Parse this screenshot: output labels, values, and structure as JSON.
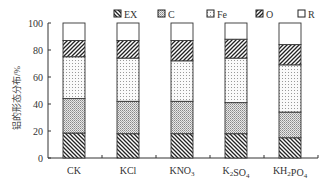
{
  "chart_data": {
    "type": "bar",
    "stacked": true,
    "title": "",
    "xlabel": "",
    "ylabel": "铝的形态分布/%",
    "ylim": [
      0,
      100
    ],
    "yticks": [
      0,
      20,
      40,
      60,
      80,
      100
    ],
    "grid": false,
    "legend_position": "top",
    "categories": [
      "CK",
      "KCl",
      "KNO3",
      "K2SO4",
      "KH2PO4"
    ],
    "category_display": [
      {
        "base": "CK",
        "subs": []
      },
      {
        "base": "KCl",
        "subs": []
      },
      {
        "parts": [
          [
            "KNO",
            false
          ],
          [
            "3",
            true
          ]
        ]
      },
      {
        "parts": [
          [
            "K",
            false
          ],
          [
            "2",
            true
          ],
          [
            "SO",
            false
          ],
          [
            "4",
            true
          ]
        ]
      },
      {
        "parts": [
          [
            "KH",
            false
          ],
          [
            "2",
            true
          ],
          [
            "PO",
            false
          ],
          [
            "4",
            true
          ]
        ]
      }
    ],
    "series": [
      {
        "name": "EX",
        "pattern": "diag-back",
        "values": [
          18.5,
          18,
          18,
          18,
          15
        ]
      },
      {
        "name": "C",
        "pattern": "dense-dots",
        "values": [
          25.5,
          24,
          24,
          23,
          19
        ]
      },
      {
        "name": "Fe",
        "pattern": "sparse-dots",
        "values": [
          31,
          32,
          30,
          33,
          35
        ]
      },
      {
        "name": "O",
        "pattern": "diag-fwd",
        "values": [
          12,
          13,
          15,
          14,
          15
        ]
      },
      {
        "name": "R",
        "pattern": "blank",
        "values": [
          13,
          13,
          13,
          12,
          16
        ]
      }
    ]
  },
  "labels": {
    "yticks": [
      "0",
      "20",
      "40",
      "60",
      "80",
      "100"
    ],
    "ylabel": "铝的形态分布/%",
    "legend": [
      "EX",
      "C",
      "Fe",
      "O",
      "R"
    ]
  }
}
